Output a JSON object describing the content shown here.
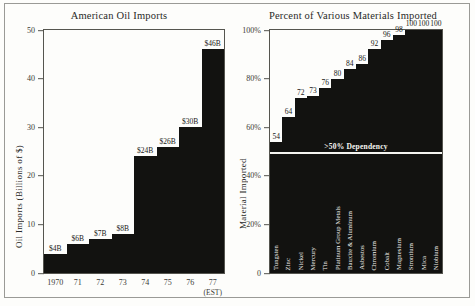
{
  "figure": {
    "background_color": "#fdfdfb",
    "frame_color": "#9a9a96",
    "bar_color": "#121210"
  },
  "chart_data": [
    {
      "type": "bar",
      "title": "American Oil Imports",
      "xlabel": "",
      "ylabel": "Oil Imports (Billions of $)",
      "ylim": [
        0,
        50
      ],
      "yticks": [
        "0",
        "10",
        "20",
        "30",
        "40",
        "50"
      ],
      "ytick_values": [
        0,
        10,
        20,
        30,
        40,
        50
      ],
      "grid": false,
      "legend": "none",
      "categories": [
        "1970",
        "71",
        "72",
        "73",
        "74",
        "75",
        "76",
        "77"
      ],
      "category_sublabels": [
        "",
        "",
        "",
        "",
        "",
        "",
        "",
        "(EST)"
      ],
      "values": [
        4,
        6,
        7,
        8,
        24,
        26,
        30,
        46
      ],
      "data_labels": [
        "$4B",
        "$6B",
        "$7B",
        "$8B",
        "$24B",
        "$26B",
        "$30B",
        "$46B"
      ]
    },
    {
      "type": "bar",
      "title": "Percent of Various Materials Imported",
      "xlabel": "",
      "ylabel": "Material Imported",
      "ylim": [
        0,
        100
      ],
      "yticks": [
        "0",
        "20%",
        "40%",
        "60%",
        "80%",
        "100%"
      ],
      "ytick_values": [
        0,
        20,
        40,
        60,
        80,
        100
      ],
      "grid": false,
      "legend": "none",
      "annotation": ">50% Dependency",
      "annotation_value": 50,
      "categories": [
        "Tungsten",
        "Zinc",
        "Nickel",
        "Mercury",
        "Tin",
        "Platinum Group Metals",
        "Bauxite & Aluminum",
        "Asbestos",
        "Chromium",
        "Cobalt",
        "Magnesium",
        "Strontium",
        "Mica",
        "Niobium"
      ],
      "values": [
        54,
        64,
        72,
        73,
        76,
        80,
        84,
        86,
        92,
        96,
        98,
        100,
        100,
        100
      ],
      "data_labels": [
        "54",
        "64",
        "72",
        "73",
        "76",
        "80",
        "84",
        "86",
        "92",
        "96",
        "98",
        "100",
        "100",
        "100"
      ]
    }
  ]
}
